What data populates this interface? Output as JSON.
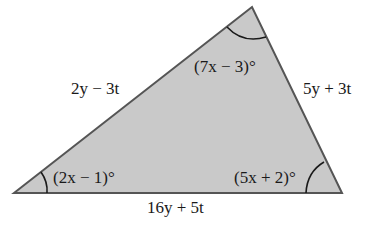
{
  "diagram": {
    "shape": "triangle",
    "fill_color": "#c9c9c9",
    "stroke_color": "#555555",
    "sides": {
      "left": "2y − 3t",
      "right": "5y + 3t",
      "bottom": "16y + 5t"
    },
    "angles": {
      "top": "(7x − 3)°",
      "bottom_left": "(2x − 1)°",
      "bottom_right": "(5x + 2)°"
    }
  }
}
